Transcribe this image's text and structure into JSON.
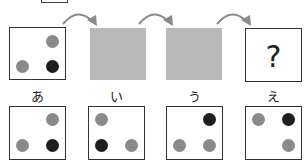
{
  "sequence": {
    "start_panel": {
      "dots": [
        {
          "pos": "top-right",
          "color": "gray"
        },
        {
          "pos": "bottom-left",
          "color": "gray"
        },
        {
          "pos": "bottom-right",
          "color": "black"
        }
      ]
    },
    "hidden_panels": 2,
    "question_mark": "?"
  },
  "options": [
    {
      "label": "あ",
      "dots": [
        {
          "pos": "top-right",
          "color": "gray"
        },
        {
          "pos": "bottom-left",
          "color": "gray"
        },
        {
          "pos": "bottom-right",
          "color": "black"
        }
      ]
    },
    {
      "label": "い",
      "dots": [
        {
          "pos": "top-left",
          "color": "gray"
        },
        {
          "pos": "bottom-left",
          "color": "black"
        },
        {
          "pos": "bottom-right",
          "color": "gray"
        }
      ]
    },
    {
      "label": "う",
      "dots": [
        {
          "pos": "top-right",
          "color": "black"
        },
        {
          "pos": "bottom-left",
          "color": "gray"
        },
        {
          "pos": "bottom-right",
          "color": "gray"
        }
      ]
    },
    {
      "label": "え",
      "dots": [
        {
          "pos": "top-left",
          "color": "gray"
        },
        {
          "pos": "top-right",
          "color": "black"
        },
        {
          "pos": "bottom-right",
          "color": "gray"
        }
      ]
    }
  ],
  "colors": {
    "gray_dot": "#8a8a8a",
    "black_dot": "#1e1e1e",
    "hidden_panel": "#b9b9b9",
    "arrow": "#8a8a8a"
  }
}
